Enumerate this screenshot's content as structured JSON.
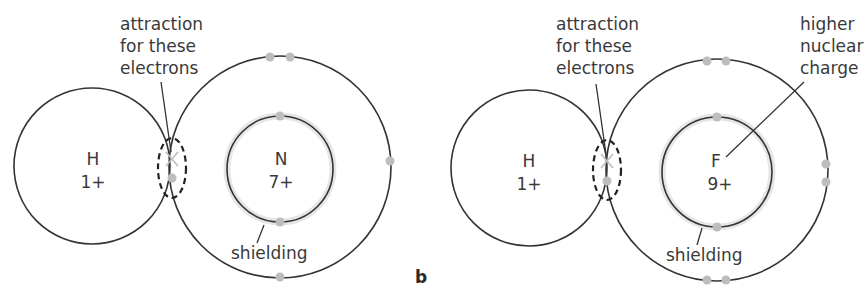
{
  "diagram": {
    "panels": [
      {
        "id": "a",
        "letter": "",
        "atom1": {
          "symbol": "H",
          "charge": "1+"
        },
        "atom2": {
          "symbol": "N",
          "charge": "7+"
        },
        "annotation_attraction": [
          "attraction",
          "for these",
          "electrons"
        ],
        "annotation_shielding": "shielding"
      },
      {
        "id": "b",
        "letter": "b",
        "atom1": {
          "symbol": "H",
          "charge": "1+"
        },
        "atom2": {
          "symbol": "F",
          "charge": "9+"
        },
        "annotation_attraction": [
          "attraction",
          "for these",
          "electrons"
        ],
        "annotation_shielding": "shielding",
        "annotation_nuclear": [
          "higher",
          "nuclear",
          "charge"
        ]
      }
    ],
    "colors": {
      "line": "#333333",
      "electron": "#bdbdbd",
      "halo": "#e6e6e6",
      "text": "#3a3a3a"
    }
  }
}
